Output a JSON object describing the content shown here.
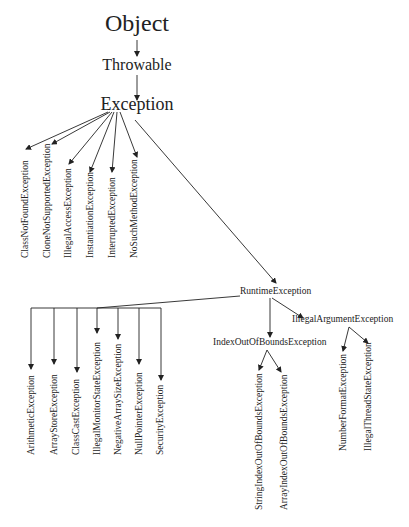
{
  "nodes": {
    "object": "Object",
    "throwable": "Throwable",
    "exception": "Exception",
    "runtime": "RuntimeException",
    "index_oob": "IndexOutOfBoundsException",
    "illegal_arg": "IllegalArgumentException"
  },
  "exception_children": [
    "ClassNotFoundException",
    "CloneNotSupportedException",
    "IllegalAccessException",
    "InstantiationException",
    "InterruptedException",
    "NoSuchMethodException"
  ],
  "runtime_children": [
    "ArithmeticException",
    "ArrayStoreException",
    "ClassCastException",
    "IllegalMonitorStateException",
    "NegativeArraySizeException",
    "NullPointerException",
    "SecurityException"
  ],
  "index_oob_children": [
    "StringIndexOutOfBoundsException",
    "ArrayIndexOutOfBoundsException"
  ],
  "illegal_arg_children": [
    "NumberFormatException",
    "IllegalThreadStateException"
  ],
  "colors": {
    "line": "#222222",
    "text": "#222222",
    "background": "#ffffff"
  }
}
